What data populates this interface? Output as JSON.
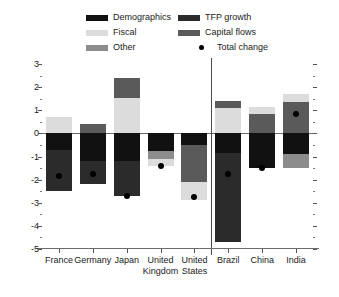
{
  "legend": {
    "items": [
      {
        "label": "Demographics",
        "color": "#111111",
        "marker": "swatch",
        "name": "legend-demographics"
      },
      {
        "label": "TFP growth",
        "color": "#2b2b2b",
        "marker": "swatch",
        "name": "legend-tfp-growth"
      },
      {
        "label": "Fiscal",
        "color": "#dcdcdc",
        "marker": "swatch",
        "name": "legend-fiscal"
      },
      {
        "label": "Capital flows",
        "color": "#5a5a5a",
        "marker": "swatch",
        "name": "legend-capital-flows"
      },
      {
        "label": "Other",
        "color": "#8c8c8c",
        "marker": "swatch",
        "name": "legend-other"
      },
      {
        "label": "Total change",
        "color": "#000000",
        "marker": "dot",
        "name": "legend-total-change"
      }
    ]
  },
  "chart_data": {
    "type": "bar",
    "title": "",
    "subtitle": "",
    "xlabel": "",
    "ylabel": "",
    "ylim": [
      -5,
      3
    ],
    "yticks": [
      3,
      2,
      1,
      0,
      -1,
      -2,
      -3,
      -4,
      -5
    ],
    "ytick_labels": [
      "3",
      "2",
      "1",
      "0",
      "-1",
      "-2",
      "-3",
      "-4",
      "-5"
    ],
    "minor_tick_step": 0.5,
    "grid": false,
    "stacked": true,
    "legend_position": "top",
    "group_divider_after": "United States",
    "categories": [
      "France",
      "Germany",
      "Japan",
      "United Kingdom",
      "United States",
      "Brazil",
      "China",
      "India"
    ],
    "category_label_lines": [
      [
        "France"
      ],
      [
        "Germany"
      ],
      [
        "Japan"
      ],
      [
        "United",
        "Kingdom"
      ],
      [
        "United",
        "States"
      ],
      [
        "Brazil"
      ],
      [
        "China"
      ],
      [
        "India"
      ]
    ],
    "series": [
      {
        "name": "Demographics",
        "color": "#111111",
        "values": [
          -0.7,
          -1.2,
          -1.2,
          -0.75,
          -0.5,
          -0.85,
          -1.5,
          -2.25
        ]
      },
      {
        "name": "TFP growth",
        "color": "#2b2b2b",
        "values": [
          -1.8,
          -1.0,
          -1.5,
          0.0,
          0.0,
          -3.85,
          0.0,
          0.0
        ]
      },
      {
        "name": "Fiscal",
        "color": "#dcdcdc",
        "values": [
          0.7,
          0.0,
          1.55,
          -0.3,
          -0.8,
          1.1,
          0.3,
          0.35
        ]
      },
      {
        "name": "Capital flows",
        "color": "#5a5a5a",
        "values": [
          0.0,
          0.4,
          0.85,
          0.0,
          -1.6,
          0.3,
          0.85,
          1.35
        ]
      },
      {
        "name": "Other",
        "color": "#8c8c8c",
        "values": [
          0.0,
          0.0,
          0.0,
          -0.35,
          0.0,
          0.0,
          0.0,
          -0.6
        ]
      }
    ],
    "total_change": [
      -1.85,
      -1.75,
      -2.7,
      -1.4,
      -2.75,
      -1.75,
      -1.5,
      0.85
    ],
    "stack_order_positive": [
      "Fiscal",
      "Capital flows"
    ],
    "stack_order_negative": [
      "Demographics",
      "Capital flows",
      "Other",
      "TFP growth",
      "Fiscal"
    ],
    "bars": [
      {
        "category": "France",
        "positive": [
          {
            "series": "Fiscal",
            "from": 0.0,
            "to": 0.7
          }
        ],
        "negative": [
          {
            "series": "Demographics",
            "from": 0.0,
            "to": -0.7
          },
          {
            "series": "TFP growth",
            "from": -0.7,
            "to": -2.5
          }
        ],
        "total": -1.85
      },
      {
        "category": "Germany",
        "positive": [
          {
            "series": "Capital flows",
            "from": 0.0,
            "to": 0.4
          }
        ],
        "negative": [
          {
            "series": "Demographics",
            "from": 0.0,
            "to": -1.2
          },
          {
            "series": "TFP growth",
            "from": -1.2,
            "to": -2.2
          }
        ],
        "total": -1.75
      },
      {
        "category": "Japan",
        "positive": [
          {
            "series": "Fiscal",
            "from": 0.0,
            "to": 1.55
          },
          {
            "series": "Capital flows",
            "from": 1.55,
            "to": 2.4
          }
        ],
        "negative": [
          {
            "series": "Demographics",
            "from": 0.0,
            "to": -1.2
          },
          {
            "series": "TFP growth",
            "from": -1.2,
            "to": -2.7
          }
        ],
        "total": -2.7
      },
      {
        "category": "United Kingdom",
        "positive": [],
        "negative": [
          {
            "series": "Demographics",
            "from": 0.0,
            "to": -0.75
          },
          {
            "series": "Other",
            "from": -0.75,
            "to": -1.1
          },
          {
            "series": "Fiscal",
            "from": -1.1,
            "to": -1.4
          }
        ],
        "total": -1.4
      },
      {
        "category": "United States",
        "positive": [],
        "negative": [
          {
            "series": "Demographics",
            "from": 0.0,
            "to": -0.5
          },
          {
            "series": "Capital flows",
            "from": -0.5,
            "to": -2.1
          },
          {
            "series": "Fiscal",
            "from": -2.1,
            "to": -2.9
          }
        ],
        "total": -2.75
      },
      {
        "category": "Brazil",
        "positive": [
          {
            "series": "Fiscal",
            "from": 0.0,
            "to": 1.1
          },
          {
            "series": "Capital flows",
            "from": 1.1,
            "to": 1.4
          }
        ],
        "negative": [
          {
            "series": "Demographics",
            "from": 0.0,
            "to": -0.85
          },
          {
            "series": "TFP growth",
            "from": -0.85,
            "to": -4.7
          }
        ],
        "total": -1.75
      },
      {
        "category": "China",
        "positive": [
          {
            "series": "Capital flows",
            "from": 0.0,
            "to": 0.85
          },
          {
            "series": "Fiscal",
            "from": 0.85,
            "to": 1.15
          }
        ],
        "negative": [
          {
            "series": "Demographics",
            "from": 0.0,
            "to": -1.5
          }
        ],
        "total": -1.5
      },
      {
        "category": "India",
        "positive": [
          {
            "series": "Capital flows",
            "from": 0.0,
            "to": 1.35
          },
          {
            "series": "Fiscal",
            "from": 1.35,
            "to": 1.7
          }
        ],
        "negative": [
          {
            "series": "Demographics",
            "from": 0.0,
            "to": -0.9
          },
          {
            "series": "Other",
            "from": -0.9,
            "to": -1.5
          }
        ],
        "total": 0.85
      }
    ]
  }
}
